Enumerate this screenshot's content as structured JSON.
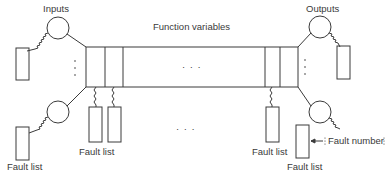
{
  "diagram": {
    "labels": {
      "inputs": "Inputs",
      "outputs": "Outputs",
      "function_variables": "Function variables",
      "fault_list_bottom_left": "Fault list",
      "fault_list_middle_left": "Fault list",
      "fault_list_middle_right": "Fault list",
      "fault_list_bottom_right": "Fault list",
      "fault_number": "Fault number",
      "ellipsis_center": "· · ·",
      "ellipsis_bottom": "· · ·"
    },
    "stroke_color": "#3a3a3a",
    "background": "#ffffff"
  }
}
